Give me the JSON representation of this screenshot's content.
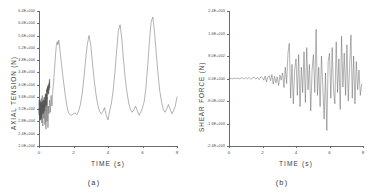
{
  "figure": {
    "panels": [
      {
        "caption": "(a)",
        "ylabel": "AXIAL TENSION (N)",
        "xlabel": "TIME (s)",
        "ytick_labels": [
          "6.4E+004",
          "6.0E+004",
          "5.6E+004",
          "5.2E+004",
          "4.8E+004",
          "4.4E+004",
          "4.0E+004",
          "3.6E+004",
          "3.2E+004",
          "2.8E+004",
          "2.4E+004",
          "2.0E+004"
        ],
        "xtick_labels": [
          "0",
          "2",
          "4",
          "6",
          "8"
        ]
      },
      {
        "caption": "(b)",
        "ylabel": "SHEAR FORCE (N)",
        "xlabel": "TIME (s)",
        "ytick_labels": [
          "2.4E+003",
          "1.6E+003",
          "8.0E+002",
          "0.0E+000",
          "-8.0E+002",
          "-1.6E+003",
          "-2.4E+003"
        ],
        "xtick_labels": [
          "0",
          "2",
          "4",
          "6",
          "8"
        ]
      }
    ]
  },
  "chart_data": [
    {
      "type": "line",
      "title": "(a)",
      "xlabel": "TIME (s)",
      "ylabel": "AXIAL TENSION (N)",
      "xlim": [
        0,
        8
      ],
      "ylim": [
        20000,
        64000
      ],
      "yticks": [
        20000,
        24000,
        28000,
        32000,
        36000,
        40000,
        44000,
        48000,
        52000,
        56000,
        60000,
        64000
      ],
      "ytick_labels": [
        "2.0E+004",
        "2.4E+004",
        "2.8E+004",
        "3.2E+004",
        "3.6E+004",
        "4.0E+004",
        "4.4E+004",
        "4.8E+004",
        "5.2E+004",
        "5.6E+004",
        "6.0E+004",
        "6.4E+004"
      ],
      "xticks": [
        0,
        2,
        4,
        6,
        8
      ],
      "xtick_labels": [
        "0",
        "2",
        "4",
        "6",
        "8"
      ],
      "grid": false,
      "legend": "none",
      "series": [
        {
          "name": "axial tension",
          "x": [
            0.0,
            0.04,
            0.07,
            0.1,
            0.13,
            0.16,
            0.19,
            0.22,
            0.25,
            0.28,
            0.31,
            0.34,
            0.37,
            0.4,
            0.43,
            0.46,
            0.49,
            0.52,
            0.55,
            0.58,
            0.62,
            0.66,
            0.7,
            0.75,
            0.8,
            0.85,
            0.9,
            0.95,
            1.0,
            1.05,
            1.1,
            1.15,
            1.2,
            1.3,
            1.4,
            1.5,
            1.6,
            1.7,
            1.8,
            1.9,
            2.0,
            2.1,
            2.2,
            2.3,
            2.4,
            2.5,
            2.6,
            2.7,
            2.8,
            2.9,
            3.0,
            3.1,
            3.2,
            3.3,
            3.4,
            3.5,
            3.6,
            3.7,
            3.8,
            3.9,
            4.0,
            4.1,
            4.2,
            4.3,
            4.4,
            4.5,
            4.6,
            4.7,
            4.8,
            4.9,
            5.0,
            5.1,
            5.2,
            5.3,
            5.4,
            5.5,
            5.6,
            5.7,
            5.8,
            5.9,
            6.0,
            6.1,
            6.2,
            6.3,
            6.4,
            6.5,
            6.6,
            6.7,
            6.8,
            6.9,
            7.0,
            7.1,
            7.2,
            7.3,
            7.4,
            7.5,
            7.6,
            7.7,
            7.8,
            7.9,
            8.0
          ],
          "y": [
            32000,
            29500,
            34000,
            28500,
            35500,
            27500,
            36500,
            26500,
            35000,
            29000,
            33500,
            27000,
            37000,
            25500,
            34500,
            28000,
            36000,
            26000,
            33000,
            30500,
            35000,
            31000,
            36500,
            33000,
            38000,
            41000,
            45000,
            49000,
            52500,
            54000,
            53000,
            54500,
            52000,
            47000,
            42000,
            37500,
            33500,
            31000,
            30200,
            30000,
            30500,
            30800,
            30200,
            31500,
            33500,
            37000,
            42000,
            48000,
            53000,
            56000,
            53000,
            47000,
            41500,
            37000,
            33500,
            31500,
            30500,
            31200,
            32500,
            30000,
            28500,
            31500,
            34000,
            38000,
            44000,
            51000,
            57500,
            59500,
            55000,
            48000,
            42000,
            37500,
            34000,
            32000,
            31000,
            31800,
            33000,
            31500,
            30000,
            31000,
            32500,
            34500,
            39000,
            46000,
            54000,
            60500,
            62000,
            57000,
            50000,
            43500,
            38000,
            34500,
            32000,
            31000,
            32000,
            33500,
            32000,
            30500,
            31500,
            33000,
            36000
          ]
        }
      ]
    },
    {
      "type": "line",
      "title": "(b)",
      "xlabel": "TIME (s)",
      "ylabel": "SHEAR FORCE (N)",
      "xlim": [
        0,
        8
      ],
      "ylim": [
        -2400,
        2400
      ],
      "yticks": [
        -2400,
        -1600,
        -800,
        0,
        800,
        1600,
        2400
      ],
      "ytick_labels": [
        "-2.4E+003",
        "-1.6E+003",
        "-8.0E+002",
        "0.0E+000",
        "8.0E+002",
        "1.6E+003",
        "2.4E+003"
      ],
      "xticks": [
        0,
        2,
        4,
        6,
        8
      ],
      "xtick_labels": [
        "0",
        "2",
        "4",
        "6",
        "8"
      ],
      "grid": false,
      "legend": "none",
      "series": [
        {
          "name": "shear force",
          "x": [
            0.0,
            0.1,
            0.2,
            0.3,
            0.4,
            0.5,
            0.6,
            0.7,
            0.8,
            0.9,
            1.0,
            1.1,
            1.2,
            1.3,
            1.4,
            1.5,
            1.6,
            1.7,
            1.8,
            1.9,
            2.0,
            2.08,
            2.16,
            2.24,
            2.32,
            2.4,
            2.48,
            2.56,
            2.64,
            2.72,
            2.8,
            2.88,
            2.96,
            3.04,
            3.12,
            3.2,
            3.28,
            3.36,
            3.44,
            3.52,
            3.6,
            3.68,
            3.76,
            3.84,
            3.92,
            4.0,
            4.08,
            4.16,
            4.24,
            4.32,
            4.4,
            4.48,
            4.56,
            4.64,
            4.72,
            4.8,
            4.88,
            4.96,
            5.04,
            5.12,
            5.2,
            5.28,
            5.36,
            5.44,
            5.52,
            5.6,
            5.68,
            5.76,
            5.84,
            5.92,
            6.0,
            6.08,
            6.16,
            6.24,
            6.32,
            6.4,
            6.48,
            6.56,
            6.64,
            6.72,
            6.8,
            6.88,
            6.96,
            7.04,
            7.12,
            7.2,
            7.28,
            7.36,
            7.44,
            7.52,
            7.6,
            7.68,
            7.76,
            7.84,
            7.92,
            8.0
          ],
          "y": [
            0,
            5,
            -10,
            15,
            -5,
            20,
            -15,
            10,
            25,
            -20,
            30,
            -10,
            40,
            -30,
            20,
            50,
            -25,
            35,
            -40,
            60,
            30,
            -60,
            90,
            -120,
            60,
            100,
            -80,
            140,
            -200,
            80,
            -150,
            60,
            -250,
            120,
            -60,
            200,
            -320,
            400,
            -180,
            900,
            1250,
            -700,
            500,
            -900,
            300,
            700,
            -600,
            850,
            -1000,
            400,
            -500,
            950,
            -850,
            1100,
            -400,
            500,
            -1150,
            300,
            850,
            -500,
            1750,
            -600,
            400,
            -1000,
            800,
            -300,
            -1450,
            200,
            -1850,
            600,
            900,
            -700,
            1100,
            -400,
            -900,
            1300,
            -500,
            700,
            -1100,
            1500,
            -300,
            900,
            -600,
            1200,
            -800,
            400,
            1550,
            -700,
            800,
            -900,
            600,
            -400,
            300,
            -600,
            -200
          ]
        }
      ]
    }
  ]
}
